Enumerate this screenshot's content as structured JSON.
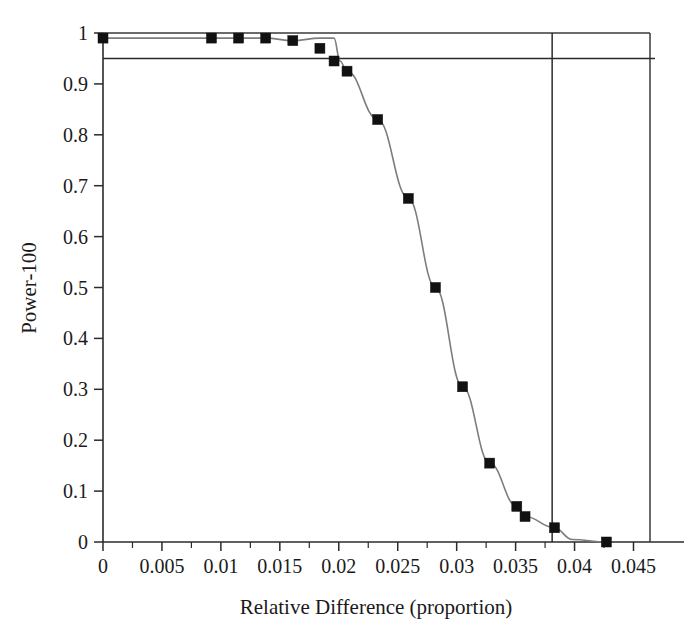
{
  "chart_data": {
    "type": "line",
    "title": "",
    "xlabel": "Relative Difference (proportion)",
    "ylabel": "Power-100",
    "xlim": [
      0,
      0.0464
    ],
    "ylim": [
      0,
      1
    ],
    "grid": false,
    "legend": "none",
    "xticks": [
      0,
      0.005,
      0.01,
      0.015,
      0.02,
      0.025,
      0.03,
      0.035,
      0.04,
      0.045
    ],
    "xticklabels": [
      "0",
      "0.005",
      "0.01",
      "0.015",
      "0.02",
      "0.025",
      "0.03",
      "0.035",
      "0.04",
      "0.045"
    ],
    "xminor_step": 0.0025,
    "yticks": [
      0,
      0.1,
      0.2,
      0.3,
      0.4,
      0.5,
      0.6,
      0.7,
      0.8,
      0.9,
      1
    ],
    "yticklabels": [
      "0",
      "0.1",
      "0.2",
      "0.3",
      "0.4",
      "0.5",
      "0.6",
      "0.7",
      "0.8",
      "0.9",
      "1"
    ],
    "series": [
      {
        "name": "power",
        "marker": "filled-square",
        "marker_color": "#111111",
        "line_color": "#7d7d7d",
        "x": [
          0.0,
          0.0092,
          0.0115,
          0.0138,
          0.0161,
          0.0184,
          0.0201,
          0.0184,
          0.0196,
          0.0207,
          0.0233,
          0.0259,
          0.0282,
          0.0305,
          0.0328,
          0.0351,
          0.0358,
          0.0383,
          0.0398,
          0.0427
        ],
        "y": [
          0.99,
          0.99,
          0.99,
          0.99,
          0.985,
          0.97,
          0.945,
          0.99,
          0.99,
          0.925,
          0.83,
          0.675,
          0.5,
          0.305,
          0.155,
          0.07,
          0.05,
          0.028,
          0.005,
          0.0
        ]
      }
    ],
    "reference_lines": [
      {
        "name": "power-threshold-line",
        "orientation": "horizontal",
        "value": 0.95,
        "color": "#2b2b2b"
      },
      {
        "name": "top-boundary-line",
        "orientation": "horizontal",
        "value": 1.0,
        "color": "#3a3a3a"
      },
      {
        "name": "critical-difference-line",
        "orientation": "vertical",
        "value": 0.0381,
        "color": "#2b2b2b"
      }
    ],
    "points": [
      {
        "x": 0.0,
        "y": 0.99
      },
      {
        "x": 0.0092,
        "y": 0.99
      },
      {
        "x": 0.0115,
        "y": 0.99
      },
      {
        "x": 0.0138,
        "y": 0.99
      },
      {
        "x": 0.0161,
        "y": 0.985
      },
      {
        "x": 0.0184,
        "y": 0.97
      },
      {
        "x": 0.0196,
        "y": 0.945
      },
      {
        "x": 0.0207,
        "y": 0.925
      },
      {
        "x": 0.0233,
        "y": 0.83
      },
      {
        "x": 0.0259,
        "y": 0.675
      },
      {
        "x": 0.0282,
        "y": 0.5
      },
      {
        "x": 0.0305,
        "y": 0.305
      },
      {
        "x": 0.0328,
        "y": 0.155
      },
      {
        "x": 0.0351,
        "y": 0.07
      },
      {
        "x": 0.0358,
        "y": 0.05
      },
      {
        "x": 0.0383,
        "y": 0.028
      },
      {
        "x": 0.0427,
        "y": 0.0
      }
    ]
  },
  "axes": {
    "y_title": "Power-100",
    "x_title": "Relative Difference (proportion)"
  }
}
